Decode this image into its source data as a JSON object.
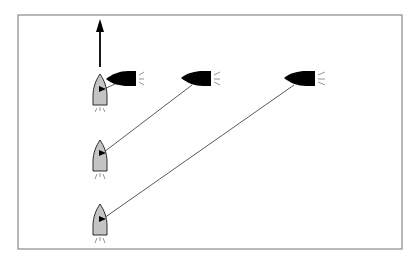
{
  "diagram": {
    "title": "Boat bearing diagram",
    "colors": {
      "background": "#ffffff",
      "frame": "#8a8a8a",
      "own_boat_fill": "#c4c4c4",
      "own_boat_stroke": "#2a2a2a",
      "other_boat_fill": "#000000",
      "sight_line": "#5a5a5a",
      "arrow": "#000000",
      "wake": "#7a7a7a"
    },
    "frame": {
      "x": 18,
      "y": 15,
      "width": 384,
      "height": 234
    },
    "heading_arrow": {
      "x": 100,
      "y_tail": 67,
      "y_head": 19,
      "direction": "north"
    },
    "own_boats": [
      {
        "id": "own-boat-1",
        "bow_x": 100,
        "bow_y": 74,
        "stern_y": 105,
        "half_width": 7
      },
      {
        "id": "own-boat-2",
        "bow_x": 100,
        "bow_y": 140,
        "stern_y": 171,
        "half_width": 7
      },
      {
        "id": "own-boat-3",
        "bow_x": 100,
        "bow_y": 204,
        "stern_y": 235,
        "half_width": 7
      }
    ],
    "other_boats": [
      {
        "id": "other-boat-1",
        "bow_x": 106,
        "bow_y": 79,
        "stern_x": 136,
        "top_y": 71,
        "bottom_y": 86
      },
      {
        "id": "other-boat-2",
        "bow_x": 181,
        "bow_y": 78,
        "stern_x": 211,
        "top_y": 71,
        "bottom_y": 86
      },
      {
        "id": "other-boat-3",
        "bow_x": 284,
        "bow_y": 78,
        "stern_x": 315,
        "top_y": 71,
        "bottom_y": 86
      }
    ],
    "sight_lines": [
      {
        "from": "other-boat-1",
        "to": "own-boat-1",
        "x1": 115,
        "y1": 84,
        "x2": 103,
        "y2": 89
      },
      {
        "from": "other-boat-2",
        "to": "own-boat-2",
        "x1": 192,
        "y1": 85,
        "x2": 103,
        "y2": 153
      },
      {
        "from": "other-boat-3",
        "to": "own-boat-3",
        "x1": 294,
        "y1": 85,
        "x2": 103,
        "y2": 219
      }
    ]
  }
}
